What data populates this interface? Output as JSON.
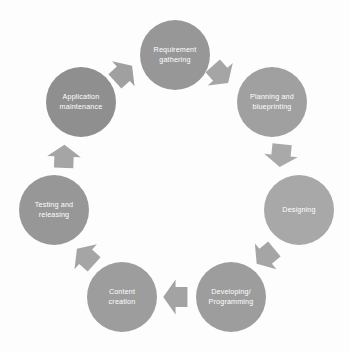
{
  "diagram": {
    "type": "circular-process",
    "background_color": "#fdfdfd",
    "label_color": "#ffffff",
    "arrow_color": "#a5a5a5",
    "center": {
      "x": 174,
      "y": 176
    },
    "steps": [
      {
        "id": "requirement-gathering",
        "order": 1,
        "lines": [
          "Requirement",
          "gathering"
        ],
        "cx": 175,
        "cy": 55,
        "r": 35,
        "color": "#979797"
      },
      {
        "id": "planning-and-blueprinting",
        "order": 2,
        "lines": [
          "Planning and",
          "blueprinting"
        ],
        "cx": 272,
        "cy": 102,
        "r": 35,
        "color": "#a0a0a0"
      },
      {
        "id": "designing",
        "order": 3,
        "lines": [
          "Designing"
        ],
        "cx": 299,
        "cy": 210,
        "r": 35,
        "color": "#a8a8a8"
      },
      {
        "id": "developing-programming",
        "order": 4,
        "lines": [
          "Developing/",
          "Programming"
        ],
        "cx": 231,
        "cy": 297,
        "r": 35,
        "color": "#9d9d9d"
      },
      {
        "id": "content-creation",
        "order": 5,
        "lines": [
          "Content",
          "creation"
        ],
        "cx": 122,
        "cy": 297,
        "r": 35,
        "color": "#9d9d9d"
      },
      {
        "id": "testing-and-releasing",
        "order": 6,
        "lines": [
          "Testing and",
          "releasing"
        ],
        "cx": 54,
        "cy": 210,
        "r": 35,
        "color": "#979797"
      },
      {
        "id": "application-maintenance",
        "order": 7,
        "lines": [
          "Application",
          "maintenance"
        ],
        "cx": 81,
        "cy": 102,
        "r": 35,
        "color": "#8f8f8f"
      }
    ],
    "arrows": [
      {
        "id": "arrow-requirement-to-planning",
        "from": "requirement-gathering",
        "to": "planning-and-blueprinting",
        "x": 220,
        "y": 74,
        "rotation": 48,
        "size": 21,
        "color": "#a5a5a5"
      },
      {
        "id": "arrow-planning-to-designing",
        "from": "planning-and-blueprinting",
        "to": "designing",
        "x": 281,
        "y": 155,
        "rotation": 96,
        "size": 21,
        "color": "#a9a9a9"
      },
      {
        "id": "arrow-designing-to-developing",
        "from": "designing",
        "to": "developing-programming",
        "x": 266,
        "y": 256,
        "rotation": 140,
        "size": 21,
        "color": "#a5a5a5"
      },
      {
        "id": "arrow-developing-to-content",
        "from": "developing-programming",
        "to": "content-creation",
        "x": 176,
        "y": 297,
        "rotation": 180,
        "size": 22,
        "color": "#a3a3a3"
      },
      {
        "id": "arrow-content-to-testing",
        "from": "content-creation",
        "to": "testing-and-releasing",
        "x": 86,
        "y": 257,
        "rotation": 222,
        "size": 21,
        "color": "#a5a5a5"
      },
      {
        "id": "arrow-testing-to-maintenance",
        "from": "testing-and-releasing",
        "to": "application-maintenance",
        "x": 64,
        "y": 157,
        "rotation": 272,
        "size": 21,
        "color": "#a5a5a5"
      },
      {
        "id": "arrow-maintenance-to-requirement",
        "from": "application-maintenance",
        "to": "requirement-gathering",
        "x": 123,
        "y": 74,
        "rotation": 318,
        "size": 21,
        "color": "#a0a0a0"
      }
    ]
  }
}
